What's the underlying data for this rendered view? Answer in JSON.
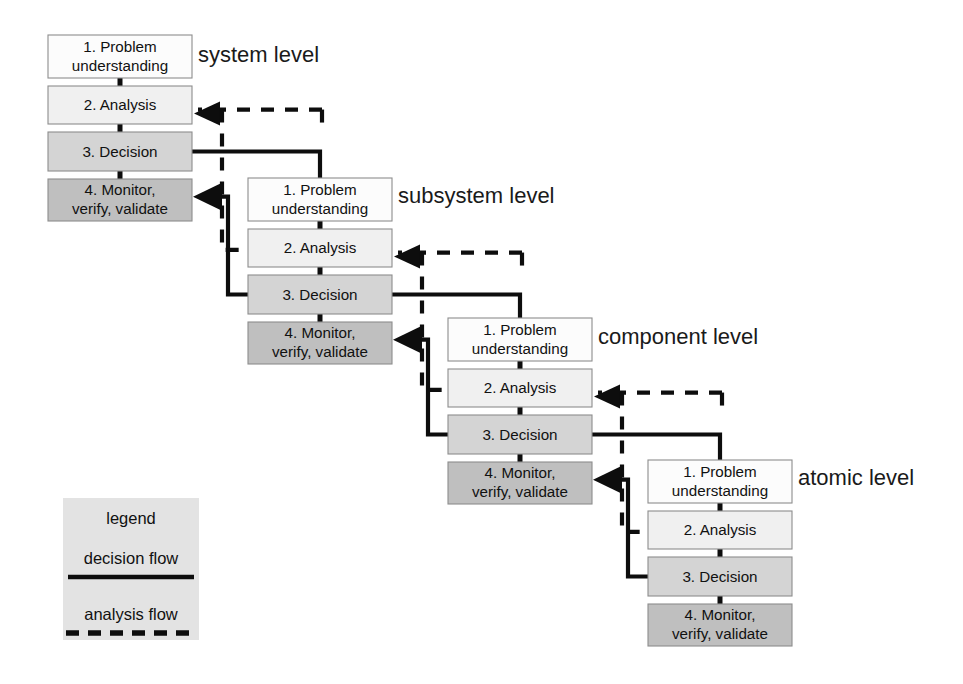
{
  "diagram": {
    "canvas": {
      "width": 963,
      "height": 684,
      "background": "#ffffff"
    },
    "step_labels": {
      "step1_line1": "1. Problem",
      "step1_line2": "understanding",
      "step2": "2. Analysis",
      "step3": "3. Decision",
      "step4_line1": "4. Monitor,",
      "step4_line2": "verify, validate"
    },
    "step_colors": {
      "step1": "#fcfcfc",
      "step2": "#f0f0f0",
      "step3": "#d4d4d4",
      "step4": "#bfbfbf",
      "border": "#8d8d8d",
      "flow_line": "#0d0d0d",
      "legend_background": "#e3e3e3"
    },
    "levels": [
      {
        "id": "system",
        "label": "system level",
        "label_x": 198,
        "label_y": 56,
        "origin_x": 48,
        "origin_y": 35,
        "has_outgoing_decision": true,
        "has_incoming_return": true
      },
      {
        "id": "subsystem",
        "label": "subsystem level",
        "label_x": 398,
        "label_y": 197,
        "origin_x": 248,
        "origin_y": 178,
        "has_outgoing_decision": true,
        "has_incoming_return": true
      },
      {
        "id": "component",
        "label": "component level",
        "label_x": 598,
        "label_y": 338,
        "origin_x": 448,
        "origin_y": 318,
        "has_outgoing_decision": true,
        "has_incoming_return": true
      },
      {
        "id": "atomic",
        "label": "atomic level",
        "label_x": 798,
        "label_y": 479,
        "origin_x": 648,
        "origin_y": 460,
        "has_outgoing_decision": false,
        "has_incoming_return": false
      }
    ],
    "box_geometry": {
      "width": 144,
      "height": 43,
      "gap": 8,
      "step1_height": 43,
      "step2_height": 38,
      "step3_height": 39,
      "step4_height": 42
    },
    "legend": {
      "x": 63,
      "y": 498,
      "width": 136,
      "height": 142,
      "title": "legend",
      "items": [
        {
          "label": "decision flow",
          "style": "solid"
        },
        {
          "label": "analysis flow",
          "style": "dashed"
        }
      ]
    },
    "flow_semantics": {
      "decision_flow": "solid line from a level's Decision step that spawns the next lower level, and returns from the lower level's Decision into this level's Monitor step",
      "analysis_flow": "dashed line that returns from the lower level back into this level's Analysis step, and passes analysis context downward"
    }
  }
}
